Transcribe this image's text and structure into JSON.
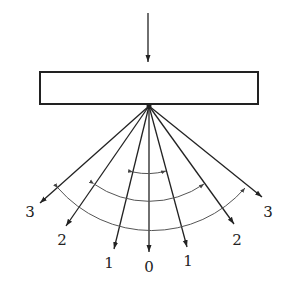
{
  "diagram": {
    "incident_arrow": "incident-light",
    "grating": "grating-plate",
    "orders": [
      {
        "side": "left",
        "label": "3"
      },
      {
        "side": "left",
        "label": "2"
      },
      {
        "side": "left",
        "label": "1"
      },
      {
        "side": "center",
        "label": "0"
      },
      {
        "side": "right",
        "label": "1"
      },
      {
        "side": "right",
        "label": "2"
      },
      {
        "side": "right",
        "label": "3"
      }
    ],
    "angle_arcs": 3,
    "colors": {
      "stroke": "#222222",
      "background": "#ffffff"
    }
  }
}
